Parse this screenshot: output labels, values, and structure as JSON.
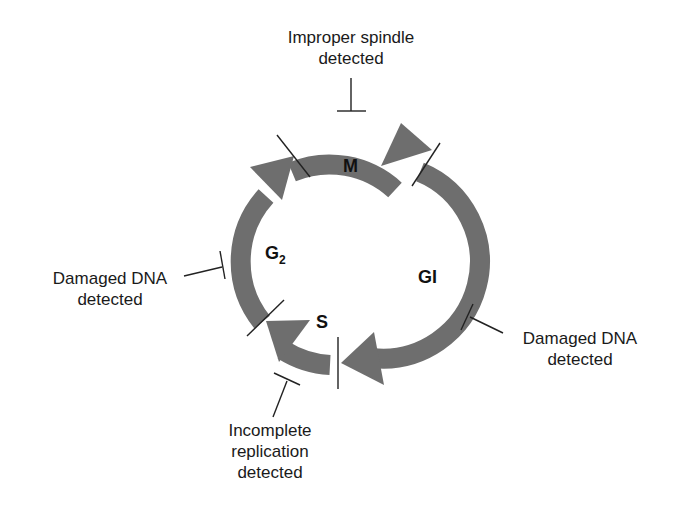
{
  "diagram": {
    "type": "cell-cycle",
    "colors": {
      "arrow": "#6e6e6e",
      "line": "#222222",
      "text": "#1a1a1a"
    },
    "phases": [
      {
        "id": "M",
        "label": "M"
      },
      {
        "id": "G1",
        "label": "GI"
      },
      {
        "id": "S",
        "label": "S"
      },
      {
        "id": "G2",
        "label": "G",
        "subscript": "2"
      }
    ],
    "checkpoints": [
      {
        "id": "spindle",
        "line1": "Improper spindle",
        "line2": "detected",
        "position": "top"
      },
      {
        "id": "dna-g2",
        "line1": "Damaged DNA",
        "line2": "detected",
        "position": "left"
      },
      {
        "id": "dna-g1",
        "line1": "Damaged DNA",
        "line2": "detected",
        "position": "right"
      },
      {
        "id": "replication",
        "line1": "Incomplete",
        "line2": "replication",
        "line3": "detected",
        "position": "bottom"
      }
    ]
  }
}
